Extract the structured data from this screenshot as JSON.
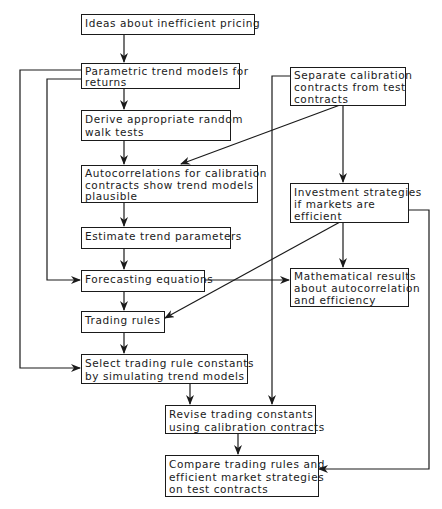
{
  "diagram": {
    "type": "flowchart",
    "nodes": [
      {
        "id": "ideas",
        "lines": [
          "Ideas about inefficient pricing"
        ]
      },
      {
        "id": "parametric",
        "lines": [
          "Parametric trend models for",
          "returns"
        ]
      },
      {
        "id": "derive",
        "lines": [
          "Derive appropriate random",
          "walk tests"
        ]
      },
      {
        "id": "autocorr",
        "lines": [
          "Autocorrelations for calibration",
          "contracts show trend models",
          "plausible"
        ]
      },
      {
        "id": "estimate",
        "lines": [
          "Estimate trend parameters"
        ]
      },
      {
        "id": "forecasting",
        "lines": [
          "Forecasting equations"
        ]
      },
      {
        "id": "trading_rules",
        "lines": [
          "Trading rules"
        ]
      },
      {
        "id": "select",
        "lines": [
          "Select trading rule constants",
          "by simulating trend models"
        ]
      },
      {
        "id": "separate",
        "lines": [
          "Separate calibration",
          "contracts from test",
          "contracts"
        ]
      },
      {
        "id": "investment",
        "lines": [
          "Investment strategies",
          "if markets are",
          "efficient"
        ]
      },
      {
        "id": "mathematical",
        "lines": [
          "Mathematical results",
          "about autocorrelation",
          "and efficiency"
        ]
      },
      {
        "id": "revise",
        "lines": [
          "Revise trading constants",
          "using calibration contracts"
        ]
      },
      {
        "id": "compare",
        "lines": [
          "Compare trading rules and",
          "efficient market strategies",
          "on test contracts"
        ]
      }
    ],
    "edges": [
      [
        "ideas",
        "parametric"
      ],
      [
        "parametric",
        "derive"
      ],
      [
        "parametric",
        "forecasting"
      ],
      [
        "parametric",
        "select"
      ],
      [
        "derive",
        "autocorr"
      ],
      [
        "separate",
        "autocorr"
      ],
      [
        "separate",
        "investment"
      ],
      [
        "separate",
        "revise"
      ],
      [
        "autocorr",
        "estimate"
      ],
      [
        "estimate",
        "forecasting"
      ],
      [
        "forecasting",
        "trading_rules"
      ],
      [
        "forecasting",
        "mathematical"
      ],
      [
        "investment",
        "mathematical"
      ],
      [
        "investment",
        "trading_rules"
      ],
      [
        "investment",
        "compare"
      ],
      [
        "trading_rules",
        "select"
      ],
      [
        "select",
        "revise"
      ],
      [
        "revise",
        "compare"
      ]
    ]
  }
}
